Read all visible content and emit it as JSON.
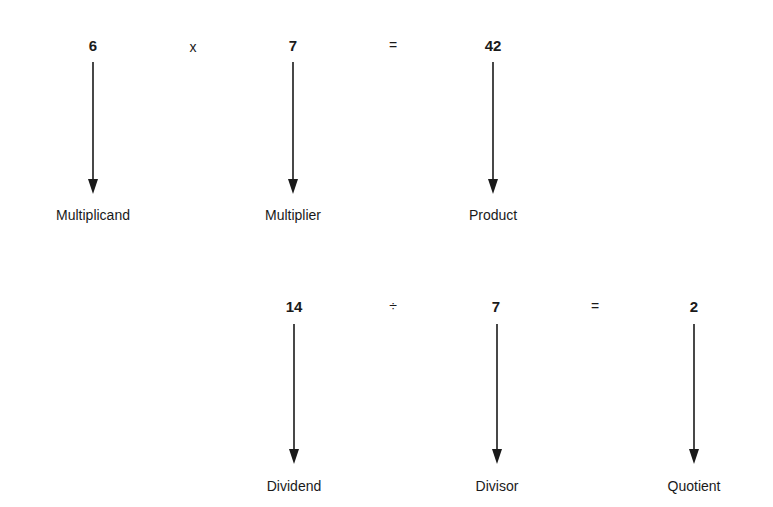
{
  "diagram": {
    "multiplication": {
      "multiplicand": {
        "value": "6",
        "label": "Multiplicand"
      },
      "operator": "x",
      "multiplier": {
        "value": "7",
        "label": "Multiplier"
      },
      "equals": "=",
      "product": {
        "value": "42",
        "label": "Product"
      }
    },
    "division": {
      "dividend": {
        "value": "14",
        "label": "Dividend"
      },
      "operator": "÷",
      "divisor": {
        "value": "7",
        "label": "Divisor"
      },
      "equals": "=",
      "quotient": {
        "value": "2",
        "label": "Quotient"
      }
    },
    "colors": {
      "ink": "#1a1a1a",
      "background": "#ffffff"
    }
  }
}
